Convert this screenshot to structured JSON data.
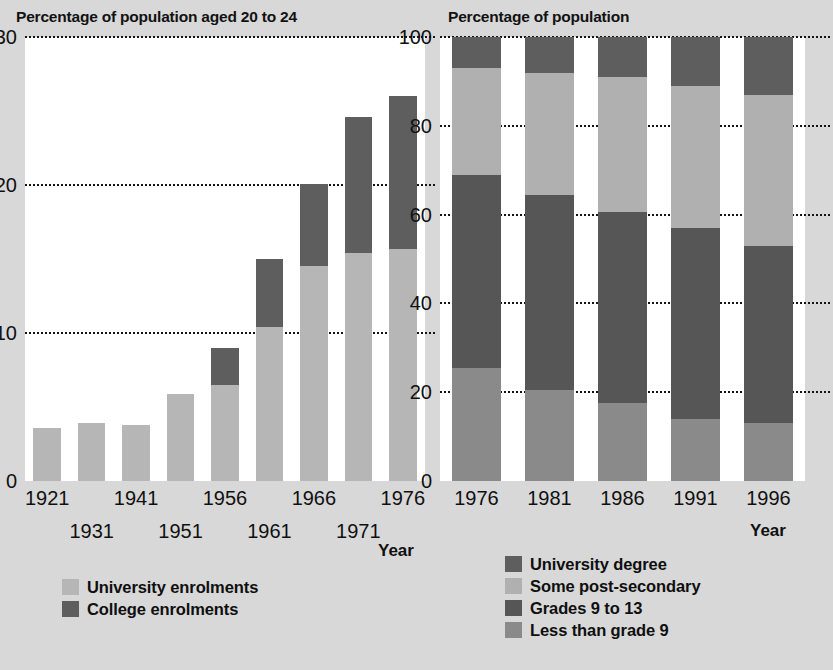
{
  "left_panel": {
    "title": "Percentage of population aged 20 to 24",
    "xlabel": "Year",
    "legend": [
      {
        "label": "University enrolments",
        "color": "#b6b6b6"
      },
      {
        "label": "College enrolments",
        "color": "#5e5e5e"
      }
    ]
  },
  "right_panel": {
    "title": "Percentage of population",
    "xlabel": "Year",
    "legend": [
      {
        "label": "University degree",
        "color": "#5e5e5e"
      },
      {
        "label": "Some post-secondary",
        "color": "#b0b0b0"
      },
      {
        "label": "Grades 9 to 13",
        "color": "#565656"
      },
      {
        "label": "Less than grade 9",
        "color": "#8a8a8a"
      }
    ]
  },
  "chart_data": [
    {
      "type": "bar",
      "stacked": true,
      "title": "Percentage of population aged 20 to 24",
      "xlabel": "Year",
      "ylabel": "",
      "ylim": [
        0,
        30
      ],
      "yticks": [
        0,
        10,
        20,
        30
      ],
      "grid": true,
      "legend_position": "below-left",
      "categories": [
        "1921",
        "1931",
        "1941",
        "1951",
        "1956",
        "1961",
        "1966",
        "1971",
        "1976"
      ],
      "series": [
        {
          "name": "University enrolments",
          "color": "#b6b6b6",
          "values": [
            3.6,
            3.9,
            3.8,
            5.9,
            6.5,
            10.4,
            14.5,
            15.4,
            15.7
          ]
        },
        {
          "name": "College enrolments",
          "color": "#5e5e5e",
          "values": [
            0.0,
            0.0,
            0.0,
            0.0,
            2.5,
            4.6,
            5.6,
            9.2,
            10.3
          ]
        }
      ],
      "totals": [
        3.6,
        3.9,
        3.8,
        5.9,
        9.0,
        15.0,
        20.1,
        24.6,
        26.0
      ]
    },
    {
      "type": "bar",
      "stacked": true,
      "title": "Percentage of population",
      "xlabel": "Year",
      "ylabel": "",
      "ylim": [
        0,
        100
      ],
      "yticks": [
        0,
        20,
        40,
        60,
        80,
        100
      ],
      "grid": true,
      "legend_position": "below",
      "categories": [
        "1976",
        "1981",
        "1986",
        "1991",
        "1996"
      ],
      "series": [
        {
          "name": "Less than grade 9",
          "color": "#8a8a8a",
          "values": [
            25.5,
            20.5,
            17.5,
            14.0,
            13.0
          ]
        },
        {
          "name": "Grades 9 to 13",
          "color": "#565656",
          "values": [
            43.5,
            44.0,
            43.0,
            43.0,
            40.0
          ]
        },
        {
          "name": "Some post-secondary",
          "color": "#b0b0b0",
          "values": [
            24.0,
            27.5,
            30.5,
            32.0,
            34.0
          ]
        },
        {
          "name": "University degree",
          "color": "#5e5e5e",
          "values": [
            7.0,
            8.0,
            9.0,
            11.0,
            13.0
          ]
        }
      ]
    }
  ]
}
